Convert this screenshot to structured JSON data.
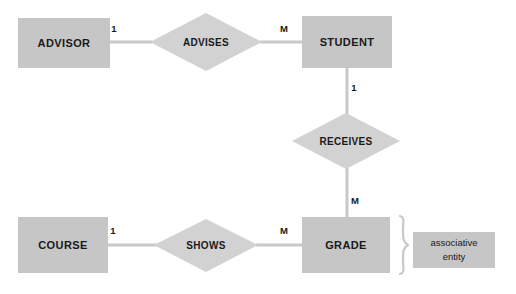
{
  "diagram": {
    "colors": {
      "entity_fill": "#c6c6c6",
      "relationship_fill": "#d2d2d2",
      "line": "#c8c8c8",
      "text": "#1a1a1a",
      "background": "#ffffff"
    },
    "entities": [
      {
        "id": "advisor",
        "label": "ADVISOR",
        "x": 18,
        "y": 18,
        "w": 92,
        "h": 50
      },
      {
        "id": "student",
        "label": "STUDENT",
        "x": 302,
        "y": 16,
        "w": 90,
        "h": 52
      },
      {
        "id": "course",
        "label": "COURSE",
        "x": 18,
        "y": 217,
        "w": 90,
        "h": 56
      },
      {
        "id": "grade",
        "label": "GRADE",
        "x": 302,
        "y": 217,
        "w": 88,
        "h": 56
      }
    ],
    "relationships": [
      {
        "id": "advises",
        "label": "ADVISES",
        "cx": 206,
        "cy": 42,
        "rx": 56,
        "ry": 29
      },
      {
        "id": "receives",
        "label": "RECEIVES",
        "cx": 346,
        "cy": 141,
        "rx": 54,
        "ry": 28
      },
      {
        "id": "shows",
        "label": "SHOWS",
        "cx": 206,
        "cy": 245,
        "rx": 52,
        "ry": 27
      }
    ],
    "connectors": [
      {
        "id": "advisor-advises",
        "x1": 110,
        "y1": 42,
        "x2": 151,
        "y2": 42
      },
      {
        "id": "advises-student",
        "x1": 261,
        "y1": 42,
        "x2": 302,
        "y2": 42
      },
      {
        "id": "student-receives",
        "x1": 347,
        "y1": 68,
        "x2": 347,
        "y2": 114
      },
      {
        "id": "receives-grade",
        "x1": 347,
        "y1": 168,
        "x2": 347,
        "y2": 217
      },
      {
        "id": "course-shows",
        "x1": 108,
        "y1": 245,
        "x2": 155,
        "y2": 245
      },
      {
        "id": "shows-grade",
        "x1": 257,
        "y1": 245,
        "x2": 302,
        "y2": 245
      }
    ],
    "cardinalities": [
      {
        "id": "advisor-side",
        "value": "1",
        "x": 114,
        "y": 29
      },
      {
        "id": "student-side",
        "value": "M",
        "x": 284,
        "y": 29
      },
      {
        "id": "student-receives-side",
        "value": "1",
        "x": 354,
        "y": 88
      },
      {
        "id": "grade-receives-side",
        "value": "M",
        "x": 355,
        "y": 201
      },
      {
        "id": "course-side",
        "value": "1",
        "x": 113,
        "y": 231
      },
      {
        "id": "grade-shows-side",
        "value": "M",
        "x": 284,
        "y": 231
      }
    ],
    "annotation": {
      "id": "associative-entity-note",
      "line1": "associative",
      "line2": "entity",
      "box": {
        "x": 413,
        "y": 232,
        "w": 82,
        "h": 36
      },
      "brace": {
        "x": 398,
        "y": 216,
        "h": 58
      }
    }
  }
}
